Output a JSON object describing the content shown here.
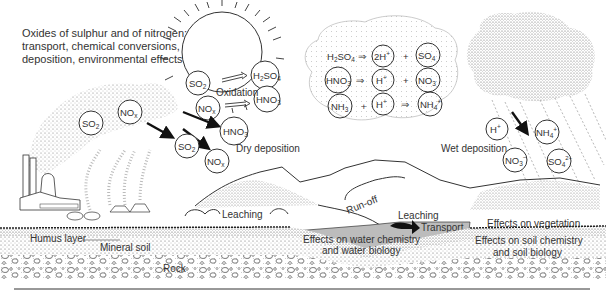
{
  "title": {
    "line1": "Oxides of sulphur and of nitrogen:",
    "line2": "transport, chemical conversions,",
    "line3": "deposition, environmental effects"
  },
  "emission": {
    "plume_molecules": [
      "SO2",
      "NOx"
    ]
  },
  "oxidation": {
    "label": "Oxidation",
    "reactants": [
      "SO2",
      "NOx"
    ],
    "products": [
      "H2SO4",
      "HNO3"
    ]
  },
  "cloud_reactions": [
    {
      "left": "H2SO4",
      "arrow": "⇒",
      "right1": "2H+",
      "plus": "+",
      "right2": "SO4 2-"
    },
    {
      "left": "HNO3",
      "arrow": "⇒",
      "right1": "H+",
      "plus": "+",
      "right2": "NO3-"
    },
    {
      "left": "NH3",
      "plus": "+",
      "mid": "H+",
      "arrow": "⇒",
      "right": "NH4+"
    }
  ],
  "dry_deposition": {
    "label": "Dry deposition",
    "molecules": [
      "HNO3",
      "SO2",
      "NOx"
    ]
  },
  "wet_deposition": {
    "label": "Wet deposition",
    "ions": [
      "H+",
      "NH4+",
      "NO3-",
      "SO4 2-"
    ]
  },
  "landscape_labels": {
    "run_off": "Run-off",
    "leaching_left": "Leaching",
    "leaching_right": "Leaching",
    "transport": "Transport",
    "humus_layer": "Humus layer",
    "mineral_soil": "Mineral soil",
    "rock": "Rock",
    "water_effects_1": "Effects on water chemistry",
    "water_effects_2": "and water biology",
    "vegetation_effects": "Effects on vegetation",
    "soil_effects_1": "Effects on soil chemistry",
    "soil_effects_2": "and soil biology"
  },
  "colors": {
    "ink": "#2a2a2a",
    "stipple": "#9a9a9a",
    "water": "#b8b8b8",
    "background": "#ffffff"
  }
}
